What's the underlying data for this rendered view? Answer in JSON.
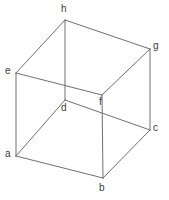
{
  "figure": {
    "type": "wireframe-cube",
    "width": 169,
    "height": 200,
    "background_color": "#ffffff",
    "edge_color": "#6f6f6f",
    "edge_width": 1,
    "label_color": "#3a3a3a",
    "label_font_size": 10
  },
  "vertices": [
    {
      "id": "a",
      "label": "a",
      "x": 16,
      "y": 156,
      "label_x": 5,
      "label_y": 149
    },
    {
      "id": "b",
      "label": "b",
      "x": 103,
      "y": 178,
      "label_x": 99,
      "label_y": 183
    },
    {
      "id": "c",
      "label": "c",
      "x": 150,
      "y": 130,
      "label_x": 153,
      "label_y": 123
    },
    {
      "id": "d",
      "label": "d",
      "x": 65,
      "y": 100,
      "label_x": 61,
      "label_y": 103
    },
    {
      "id": "e",
      "label": "e",
      "x": 16,
      "y": 73,
      "label_x": 5,
      "label_y": 66
    },
    {
      "id": "f",
      "label": "f",
      "x": 102,
      "y": 95,
      "label_x": 99,
      "label_y": 97
    },
    {
      "id": "g",
      "label": "g",
      "x": 150,
      "y": 49,
      "label_x": 153,
      "label_y": 41
    },
    {
      "id": "h",
      "label": "h",
      "x": 65,
      "y": 20,
      "label_x": 61,
      "label_y": 4
    }
  ],
  "edges": [
    {
      "id": "a-b",
      "from": "a",
      "to": "b"
    },
    {
      "id": "b-c",
      "from": "b",
      "to": "c"
    },
    {
      "id": "c-d",
      "from": "c",
      "to": "d"
    },
    {
      "id": "d-a",
      "from": "d",
      "to": "a"
    },
    {
      "id": "e-f",
      "from": "e",
      "to": "f"
    },
    {
      "id": "f-g",
      "from": "f",
      "to": "g"
    },
    {
      "id": "g-h",
      "from": "g",
      "to": "h"
    },
    {
      "id": "h-e",
      "from": "h",
      "to": "e"
    },
    {
      "id": "a-e",
      "from": "a",
      "to": "e"
    },
    {
      "id": "b-f",
      "from": "b",
      "to": "f"
    },
    {
      "id": "c-g",
      "from": "c",
      "to": "g"
    },
    {
      "id": "d-h",
      "from": "d",
      "to": "h"
    }
  ]
}
